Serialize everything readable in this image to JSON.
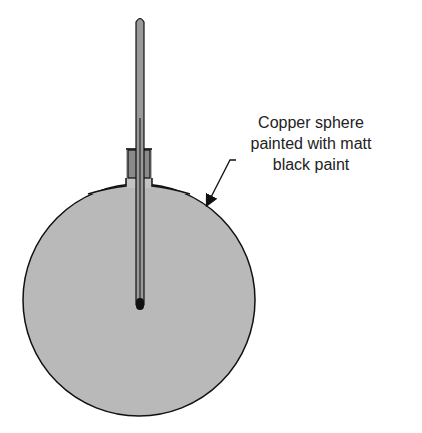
{
  "diagram": {
    "label_lines": [
      "Copper sphere",
      "painted with matt",
      "black paint"
    ],
    "colors": {
      "sphere_fill": "#b9b9b9",
      "neck_fill": "#c4c4c4",
      "stopper_fill": "#8a8a8a",
      "thermometer_fill": "#9a9a9a",
      "outline": "#111111"
    },
    "components": [
      "copper-sphere",
      "neck",
      "stopper",
      "thermometer",
      "thermometer-bulb",
      "pointer-arrow"
    ]
  }
}
